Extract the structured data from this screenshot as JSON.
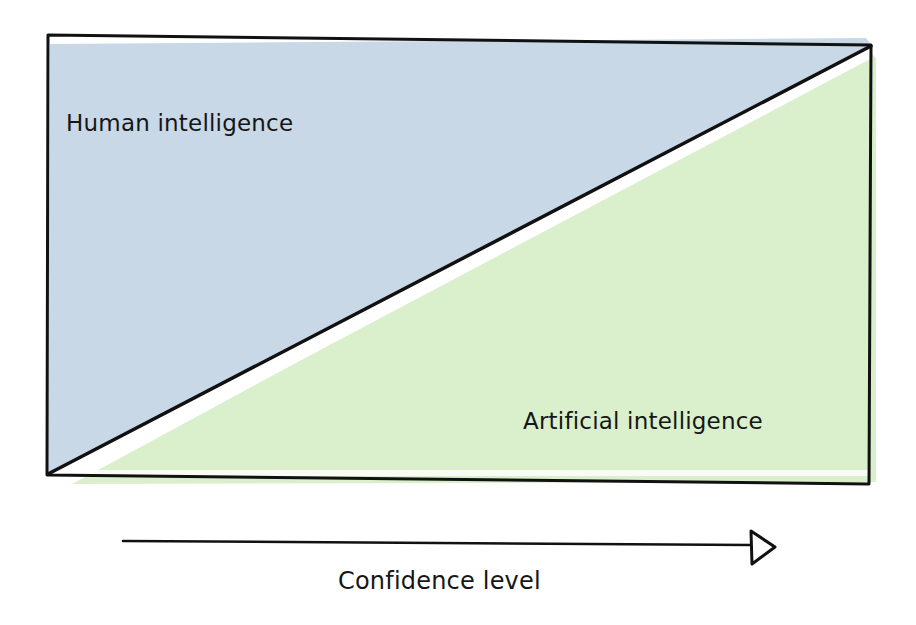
{
  "diagram": {
    "regions": [
      {
        "id": "human",
        "label": "Human intelligence",
        "color": "#c8d8e6",
        "position": "upper-left triangle"
      },
      {
        "id": "ai",
        "label": "Artificial intelligence",
        "color": "#daf0cc",
        "position": "lower-right triangle"
      }
    ],
    "divider": {
      "from": "bottom-left",
      "to": "top-right",
      "color": "#111111"
    },
    "frame_color": "#111111",
    "axis": {
      "label": "Confidence level",
      "direction": "increasing to the right",
      "arrow_head": "open-triangle"
    }
  }
}
